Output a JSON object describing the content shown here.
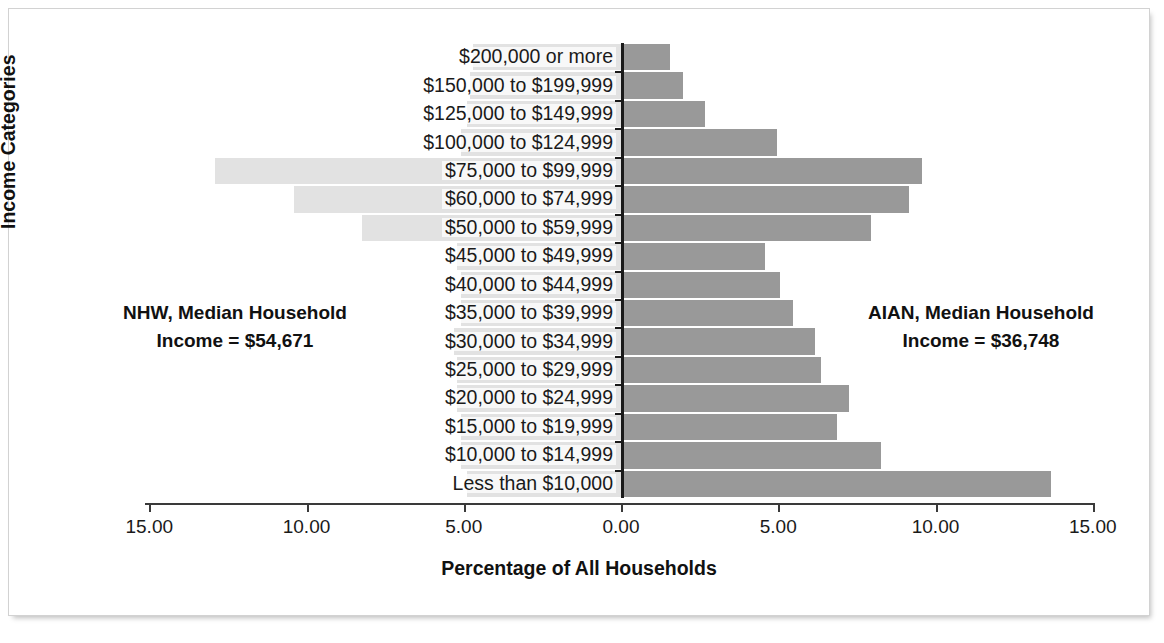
{
  "chart_data": {
    "type": "bar",
    "subtype": "diverging-population-pyramid",
    "title": "",
    "xlabel": "Percentage of All Households",
    "ylabel": "Income Categories",
    "xlim": [
      -15,
      15
    ],
    "xticks": [
      "15.00",
      "10.00",
      "5.00",
      "0.00",
      "5.00",
      "10.00",
      "15.00"
    ],
    "xtick_values": [
      -15,
      -10,
      -5,
      0,
      5,
      10,
      15
    ],
    "grid": false,
    "legend": "none",
    "categories": [
      "$200,000 or more",
      "$150,000 to $199,999",
      "$125,000 to $149,999",
      "$100,000 to $124,999",
      "$75,000 to $99,999",
      "$60,000 to $74,999",
      "$50,000 to $59,999",
      "$45,000 to $49,999",
      "$40,000 to $44,999",
      "$35,000 to $39,999",
      "$30,000 to $34,999",
      "$25,000 to $29,999",
      "$20,000 to $24,999",
      "$15,000 to $19,999",
      "$10,000 to $14,999",
      "Less than $10,000"
    ],
    "series": [
      {
        "name": "NHW",
        "side": "left",
        "color": "#e2e2e2",
        "values": [
          4.7,
          4.8,
          4.9,
          5.1,
          12.9,
          10.4,
          8.25,
          5.2,
          5.1,
          5.1,
          5.3,
          5.2,
          5.2,
          5.1,
          5.1,
          4.9
        ]
      },
      {
        "name": "AIAN",
        "side": "right",
        "color": "#999999",
        "values": [
          1.5,
          1.9,
          2.6,
          4.9,
          9.5,
          9.1,
          7.9,
          4.5,
          5.0,
          5.4,
          6.1,
          6.3,
          7.2,
          6.8,
          8.2,
          13.6
        ]
      }
    ],
    "annotations": [
      {
        "id": "nhw-median",
        "line1": "NHW, Median Household",
        "line2": "Income = $54,671",
        "position": "left"
      },
      {
        "id": "aian-median",
        "line1": "AIAN, Median Household",
        "line2": "Income = $36,748",
        "position": "right"
      }
    ]
  }
}
